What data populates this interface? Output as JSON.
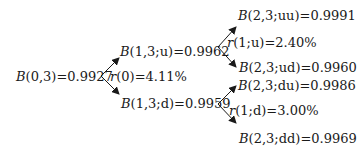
{
  "tree": {
    "root": {
      "sym": "B",
      "args": "(0,3)",
      "value": "=0.9927"
    },
    "rate0": {
      "sym": "r",
      "args": "(0)",
      "value": "=4.11%"
    },
    "level1": {
      "up": {
        "sym": "B",
        "args": "(1,3;u)",
        "value": "=0.9962"
      },
      "down": {
        "sym": "B",
        "args": "(1,3;d)",
        "value": "=0.9959"
      }
    },
    "rate1u": {
      "sym": "r",
      "args": "(1;u)",
      "value": "=2.40%"
    },
    "rate1d": {
      "sym": "r",
      "args": "(1;d)",
      "value": "=3.00%"
    },
    "level2": {
      "uu": {
        "sym": "B",
        "args": "(2,3;uu)",
        "value": "=0.9991"
      },
      "ud": {
        "sym": "B",
        "args": "(2,3;ud)",
        "value": "=0.9960"
      },
      "du": {
        "sym": "B",
        "args": "(2,3;du)",
        "value": "=0.9986"
      },
      "dd": {
        "sym": "B",
        "args": "(2,3;dd)",
        "value": "=0.9969"
      }
    }
  },
  "colors": {
    "ink": "#1a1a1a",
    "background": "#ffffff"
  }
}
